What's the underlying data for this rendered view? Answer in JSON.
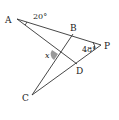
{
  "diagram": {
    "type": "geometry",
    "points": {
      "A": {
        "label": "A",
        "x": 17,
        "y": 19
      },
      "B": {
        "label": "B",
        "x": 73,
        "y": 34
      },
      "P": {
        "label": "P",
        "x": 101,
        "y": 45
      },
      "C": {
        "label": "C",
        "x": 32,
        "y": 95
      },
      "D": {
        "label": "D",
        "x": 77,
        "y": 64
      }
    },
    "segments": [
      [
        "A",
        "P"
      ],
      [
        "A",
        "D"
      ],
      [
        "C",
        "B"
      ],
      [
        "C",
        "P"
      ]
    ],
    "angles": {
      "A": {
        "value": "20°"
      },
      "P": {
        "value": "48°"
      },
      "x": {
        "value": "x"
      }
    }
  }
}
